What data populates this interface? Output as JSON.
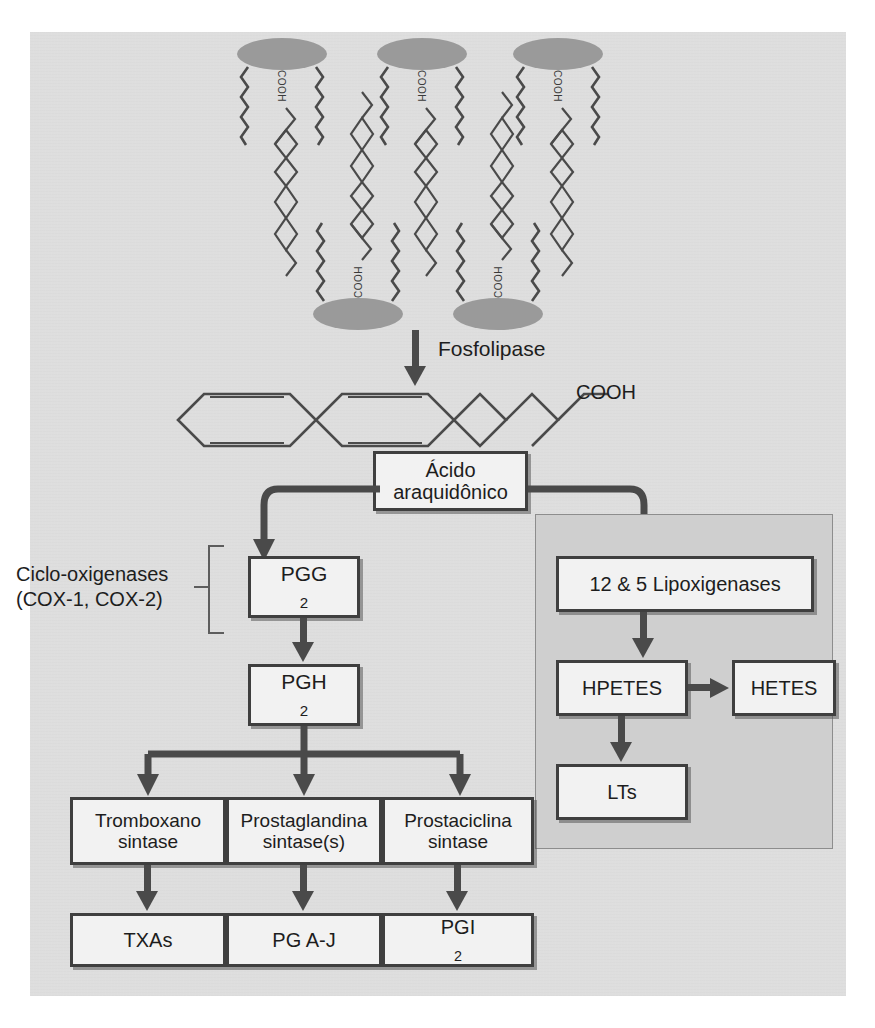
{
  "figure": {
    "language": "pt-BR",
    "background_color": "#dedede",
    "lox_panel_color": "#cfcfcf",
    "box_fill": "#f2f2f2",
    "box_border": "#3f3f3f",
    "arrow_color": "#4a4a4a",
    "lipid_head_color": "#9a9a9a"
  },
  "membrane": {
    "label": "fosfolipid-membrane",
    "molecule_label": "COOH",
    "upper_row_count": 3,
    "lower_row_count": 2
  },
  "enzyme_steps": {
    "phospholipase": "Fosfolipase",
    "cyclooxygenases_line1": "Ciclo-oxigenases",
    "cyclooxygenases_line2": "(COX-1, COX-2)"
  },
  "free_acid": {
    "cooh": "COOH"
  },
  "nodes": {
    "arachidonic_acid_line1": "Ácido",
    "arachidonic_acid_line2": "araquidônico",
    "pgg2_text": "PGG",
    "pgg2_sub": "2",
    "pgh2_text": "PGH",
    "pgh2_sub": "2",
    "lipoxygenases": "12 & 5 Lipoxigenases",
    "hpetes": "HPETES",
    "hetes": "HETES",
    "lts": "LTs",
    "thromboxane_line1": "Tromboxano",
    "thromboxane_line2": "sintase",
    "prostaglandin_line1": "Prostaglandina",
    "prostaglandin_line2": "sintase(s)",
    "prostacyclin_line1": "Prostaciclina",
    "prostacyclin_line2": "sintase",
    "txas": "TXAs",
    "pg_aj": "PG A-J",
    "pgi2_text": "PGI",
    "pgi2_sub": "2"
  }
}
